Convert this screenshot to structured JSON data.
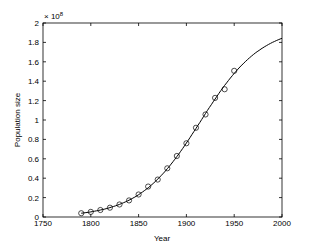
{
  "chart_data": {
    "type": "scatter",
    "title": "",
    "xlabel": "Year",
    "ylabel": "Population size",
    "y_multiplier_label": "× 10",
    "y_multiplier_exponent": "8",
    "xlim": [
      1750,
      2000
    ],
    "ylim": [
      0,
      2
    ],
    "xticks": [
      1750,
      1800,
      1850,
      1900,
      1950,
      2000
    ],
    "yticks": [
      0,
      0.2,
      0.4,
      0.6,
      0.8,
      1,
      1.2,
      1.4,
      1.6,
      1.8,
      2
    ],
    "ytick_labels": [
      "0",
      "0.2",
      "0.4",
      "0.6",
      "0.8",
      "1",
      "1.2",
      "1.4",
      "1.6",
      "1.8",
      "2"
    ],
    "xtick_labels": [
      "1750",
      "1800",
      "1850",
      "1900",
      "1950",
      "2000"
    ],
    "grid": false,
    "legend": null,
    "series": [
      {
        "name": "Census data",
        "style": "open-circle markers",
        "x": [
          1790,
          1800,
          1810,
          1820,
          1830,
          1840,
          1850,
          1860,
          1870,
          1880,
          1890,
          1900,
          1910,
          1920,
          1930,
          1940,
          1950
        ],
        "values": [
          0.039,
          0.053,
          0.072,
          0.096,
          0.129,
          0.171,
          0.232,
          0.314,
          0.386,
          0.502,
          0.629,
          0.76,
          0.92,
          1.057,
          1.228,
          1.317,
          1.507
        ]
      },
      {
        "name": "Logistic fit",
        "style": "solid line",
        "x": [
          1790,
          1800,
          1820,
          1840,
          1860,
          1880,
          1900,
          1920,
          1940,
          1950,
          1960,
          1980,
          2000
        ],
        "values": [
          0.039,
          0.052,
          0.092,
          0.16,
          0.273,
          0.45,
          0.7,
          1.0,
          1.31,
          1.44,
          1.56,
          1.74,
          1.85
        ]
      }
    ]
  }
}
